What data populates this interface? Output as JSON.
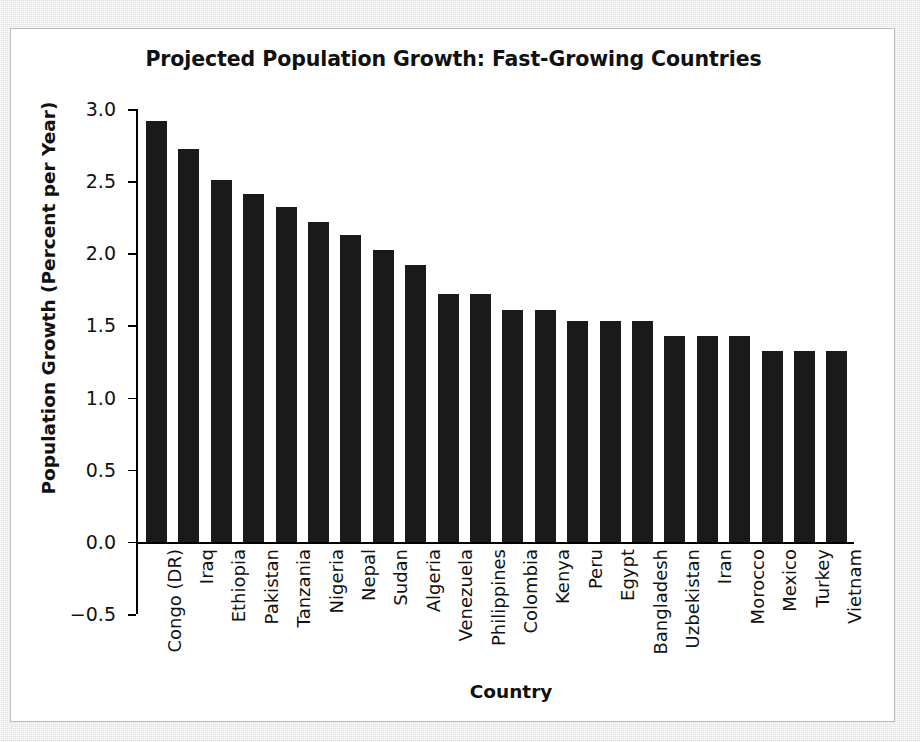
{
  "figure": {
    "background_color": "#e9e9e9",
    "card_color": "#ffffff",
    "bar_color": "#1a1a1a",
    "axis_color": "#000000"
  },
  "chart_data": {
    "type": "bar",
    "title": "Projected Population Growth: Fast-Growing Countries",
    "xlabel": "Country",
    "ylabel": "Population Growth (Percent per Year)",
    "ylim": [
      -0.5,
      3.0
    ],
    "yticks": [
      3.0,
      2.5,
      2.0,
      1.5,
      1.0,
      0.5,
      0.0,
      -0.5
    ],
    "ytick_labels": [
      "3.0",
      "2.5",
      "2.0",
      "1.5",
      "1.0",
      "0.5",
      "0.0",
      "−0.5"
    ],
    "grid": false,
    "legend": false,
    "categories": [
      "Congo (DR)",
      "Iraq",
      "Ethiopia",
      "Pakistan",
      "Tanzania",
      "Nigeria",
      "Nepal",
      "Sudan",
      "Algeria",
      "Venezuela",
      "Philippines",
      "Colombia",
      "Kenya",
      "Peru",
      "Egypt",
      "Bangladesh",
      "Uzbekistan",
      "Iran",
      "Morocco",
      "Mexico",
      "Turkey",
      "Vietnam"
    ],
    "values": [
      2.92,
      2.72,
      2.51,
      2.41,
      2.32,
      2.22,
      2.13,
      2.02,
      1.92,
      1.72,
      1.72,
      1.61,
      1.61,
      1.53,
      1.53,
      1.53,
      1.43,
      1.43,
      1.43,
      1.32,
      1.32,
      1.32
    ]
  }
}
